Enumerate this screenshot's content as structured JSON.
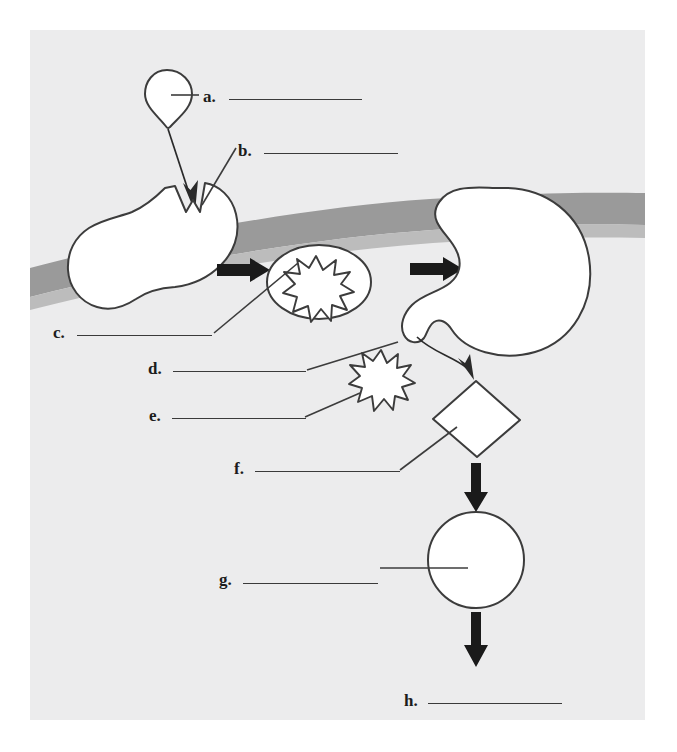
{
  "figure": {
    "kind": "labeled-biology-diagram",
    "panel": {
      "background_color": "#ececed",
      "page_background_color": "#ffffff"
    }
  },
  "colors": {
    "ink": "#1c1c1c",
    "rule": "#3a3a3a",
    "outline": "#3c3c3c",
    "shape_fill": "#ffffff",
    "band_gray": "#9a9a9a",
    "band_gray_light": "#b4b4b4",
    "panel_gray": "#ececed"
  },
  "labels": [
    {
      "id": "a",
      "letter": "a.",
      "answer": "",
      "x": 203,
      "y": 88,
      "rule_x": 229,
      "rule_y": 99,
      "rule_w": 133
    },
    {
      "id": "b",
      "letter": "b.",
      "answer": "",
      "x": 238,
      "y": 142,
      "rule_x": 264,
      "rule_y": 153,
      "rule_w": 134
    },
    {
      "id": "c",
      "letter": "c.",
      "answer": "",
      "x": 53,
      "y": 324,
      "rule_x": 77,
      "rule_y": 335,
      "rule_w": 135
    },
    {
      "id": "d",
      "letter": "d.",
      "answer": "",
      "x": 148,
      "y": 360,
      "rule_x": 173,
      "rule_y": 371,
      "rule_w": 133
    },
    {
      "id": "e",
      "letter": "e.",
      "answer": "",
      "x": 149,
      "y": 407,
      "rule_x": 172,
      "rule_y": 418,
      "rule_w": 134
    },
    {
      "id": "f",
      "letter": "f.",
      "answer": "",
      "x": 234,
      "y": 460,
      "rule_x": 255,
      "rule_y": 471,
      "rule_w": 145
    },
    {
      "id": "g",
      "letter": "g.",
      "answer": "",
      "x": 219,
      "y": 571,
      "rule_x": 243,
      "rule_y": 583,
      "rule_w": 135
    },
    {
      "id": "h",
      "letter": "h.",
      "answer": "",
      "x": 404,
      "y": 692,
      "rule_x": 428,
      "rule_y": 703,
      "rule_w": 134
    }
  ],
  "shapes": [
    {
      "name": "teardrop-particle",
      "target_label": "a"
    },
    {
      "name": "notched-cell",
      "target_label": "b"
    },
    {
      "name": "vesicle-oval-with-burst",
      "target_label": "c"
    },
    {
      "name": "burst-inside-vesicle",
      "target_label": "d"
    },
    {
      "name": "free-burst",
      "target_label": "e"
    },
    {
      "name": "diamond-particle",
      "target_label": "f"
    },
    {
      "name": "circle-product",
      "target_label": "g"
    },
    {
      "name": "final-output",
      "target_label": "h"
    },
    {
      "name": "kidney-cell",
      "target_label": null
    },
    {
      "name": "membrane-band",
      "target_label": null
    }
  ],
  "arrows": [
    {
      "name": "downward-engulf-arrow",
      "style": "thin"
    },
    {
      "name": "rightward-arrow-1",
      "style": "thick"
    },
    {
      "name": "rightward-arrow-2",
      "style": "thick"
    },
    {
      "name": "curved-exit-arrow",
      "style": "thin-curved"
    },
    {
      "name": "down-arrow-to-circle",
      "style": "thick"
    },
    {
      "name": "down-arrow-to-output",
      "style": "thick"
    }
  ],
  "bleed_through": [
    {
      "text": "",
      "x": 400,
      "y": 88
    },
    {
      "text": "",
      "x": 400,
      "y": 310
    }
  ]
}
